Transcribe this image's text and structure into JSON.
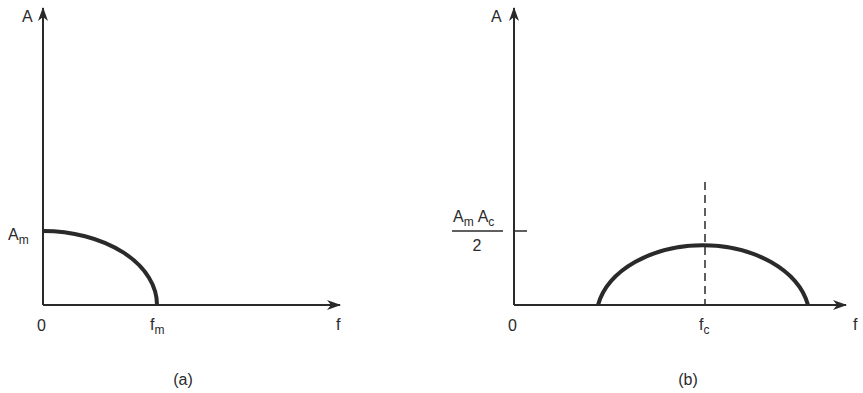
{
  "figure": {
    "panels": [
      {
        "id": "a",
        "caption": "(a)",
        "y_axis_label": "A",
        "x_axis_label": "f",
        "origin_label": "0",
        "y_tick": {
          "base": "A",
          "sub": "m"
        },
        "x_tick": {
          "base": "f",
          "sub": "m"
        },
        "description": "Baseband spectrum: quarter-ellipse from amplitude A_m at f=0 down to zero at f_m"
      },
      {
        "id": "b",
        "caption": "(b)",
        "y_axis_label": "A",
        "x_axis_label": "f",
        "origin_label": "0",
        "y_tick": {
          "num1_base": "A",
          "num1_sub": "m",
          "num2_base": "A",
          "num2_sub": "c",
          "den": "2"
        },
        "x_tick": {
          "base": "f",
          "sub": "c"
        },
        "description": "Modulated spectrum: half-ellipse centered at carrier f_c with peak A_m A_c / 2, dashed line at f_c"
      }
    ]
  },
  "colors": {
    "stroke": "#2a2a2a",
    "background": "#ffffff"
  }
}
